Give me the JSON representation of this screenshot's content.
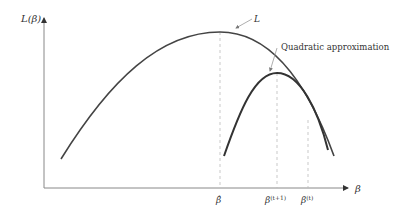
{
  "diagram": {
    "y_axis_label": "L(β)",
    "x_axis_label": "β",
    "curve_label": "L",
    "approx_label": "Quadratic approximation",
    "ticks": [
      {
        "label": "β̂",
        "sup": ""
      },
      {
        "label": "β",
        "sup": "(t+1)"
      },
      {
        "label": "β",
        "sup": "(t)"
      }
    ],
    "colors": {
      "axis": "#777777",
      "curve": "#444444",
      "dash": "#bbbbbb",
      "text": "#333333"
    }
  }
}
